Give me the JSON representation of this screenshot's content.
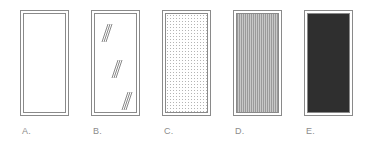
{
  "figure": {
    "panels": [
      {
        "id": "A",
        "label": "A.",
        "fill": "empty",
        "left": 20
      },
      {
        "id": "B",
        "label": "B.",
        "fill": "glass-glints",
        "left": 91
      },
      {
        "id": "C",
        "label": "C.",
        "fill": "dotted",
        "left": 162
      },
      {
        "id": "D",
        "label": "D.",
        "fill": "vertical-stripes",
        "left": 233
      },
      {
        "id": "E",
        "label": "E.",
        "fill": "dark-solid",
        "left": 304
      }
    ],
    "colors": {
      "frame": "#8a8a8a",
      "label": "#8c8c8c",
      "dots": "#b4b4b4",
      "stripes_dark": "#9a9a9a",
      "stripes_light": "#c8c8c8",
      "dark_fill": "#2f2f2f"
    }
  }
}
